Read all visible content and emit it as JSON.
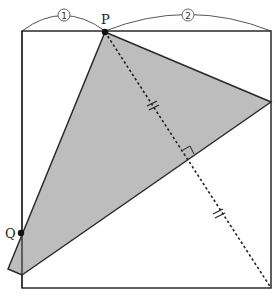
{
  "diagram": {
    "labels": {
      "P": "P",
      "Q": "Q",
      "ratio_left": "1",
      "ratio_right": "2"
    },
    "colors": {
      "stroke": "#2a2a2a",
      "shade": "#bdbdbd",
      "background": "#ffffff"
    },
    "square": {
      "x": 22,
      "y": 31,
      "size_w": 249,
      "size_h": 257
    },
    "points": {
      "P": [
        105,
        32
      ],
      "Q": [
        21,
        233
      ],
      "right_vertex": [
        271,
        102
      ],
      "fold_bottom": [
        22,
        275
      ],
      "flap_tip": [
        8,
        269
      ],
      "bottom_right": [
        271,
        288
      ],
      "right_angle": [
        188,
        160
      ]
    },
    "marks": {
      "equal_tick_1": [
        153,
        107
      ],
      "equal_tick_2": [
        219,
        215
      ]
    }
  }
}
